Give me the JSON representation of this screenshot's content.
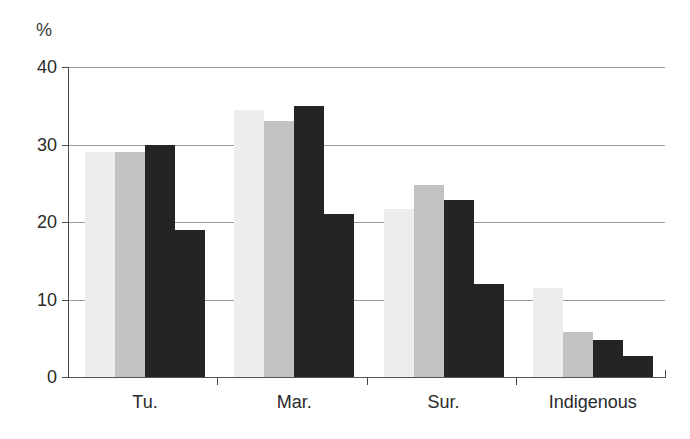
{
  "chart_data": {
    "type": "bar",
    "title": "",
    "xlabel": "",
    "ylabel": "%",
    "ylim": [
      0,
      40
    ],
    "yticks": [
      0,
      10,
      20,
      30,
      40
    ],
    "ytick_labels": [
      "0",
      "10",
      "20",
      "30",
      "40"
    ],
    "grid": true,
    "legend": "none",
    "categories": [
      "Tu.",
      "Mar.",
      "Sur.",
      "Indigenous"
    ],
    "series": [
      {
        "name": "series-1",
        "color": "#ededed",
        "values": [
          29.0,
          34.5,
          21.7,
          11.5
        ]
      },
      {
        "name": "series-2",
        "color": "#c2c2c2",
        "values": [
          29.0,
          33.0,
          24.8,
          5.8
        ]
      },
      {
        "name": "series-3",
        "color": "#242424",
        "values": [
          30.0,
          35.0,
          22.8,
          4.8
        ]
      },
      {
        "name": "series-4",
        "color": "#242424",
        "values": [
          19.0,
          21.0,
          12.0,
          2.7
        ]
      }
    ]
  },
  "axis": {
    "unit_label": "%"
  }
}
